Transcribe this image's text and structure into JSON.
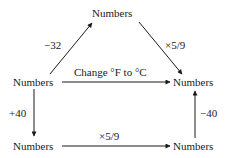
{
  "diagram": {
    "nodes": {
      "top": "Numbers",
      "mid_left": "Numbers",
      "mid_right": "Numbers",
      "bottom_left": "Numbers",
      "bottom_right": "Numbers"
    },
    "edges": {
      "mid_left_to_top": "−32",
      "top_to_mid_right": "×5/9",
      "mid_left_to_mid_right": "Change °F to °C",
      "mid_left_to_bottom_left": "+40",
      "bottom_left_to_bottom_right": "×5/9",
      "bottom_right_to_mid_right": "−40"
    },
    "colors": {
      "ink": "#1a1a1a",
      "background": "#ffffff"
    }
  }
}
